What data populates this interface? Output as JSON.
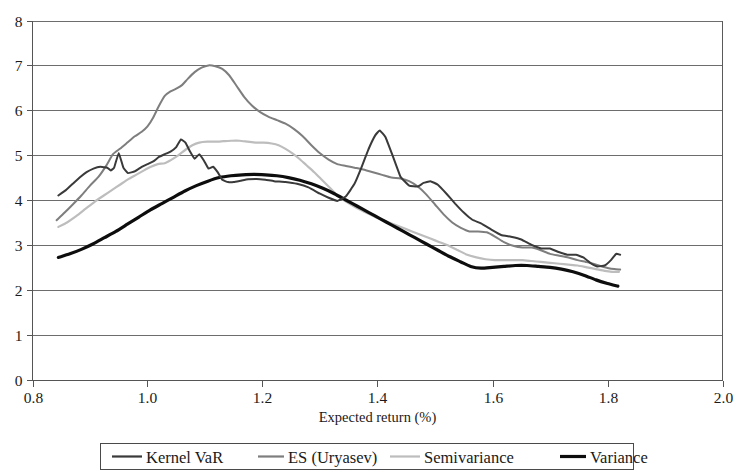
{
  "chart_data": {
    "type": "line",
    "title": "",
    "xlabel": "Expected return (%)",
    "ylabel": "",
    "xlim": [
      0.8,
      2.0
    ],
    "ylim": [
      0,
      8
    ],
    "xticks": [
      "0.8",
      "1.0",
      "1.2",
      "1.4",
      "1.6",
      "1.8",
      "2.0"
    ],
    "xtick_values": [
      0.8,
      1.0,
      1.2,
      1.4,
      1.6,
      1.8,
      2.0
    ],
    "yticks": [
      "0",
      "1",
      "2",
      "3",
      "4",
      "5",
      "6",
      "7",
      "8"
    ],
    "ytick_values": [
      0,
      1,
      2,
      3,
      4,
      5,
      6,
      7,
      8
    ],
    "grid": "horizontal",
    "legend_position": "bottom",
    "series": [
      {
        "name": "Kernel VaR",
        "color": "#3a3a3a",
        "width": 2.0,
        "x": [
          0.845,
          0.858,
          0.87,
          0.882,
          0.894,
          0.906,
          0.918,
          0.93,
          0.936,
          0.942,
          0.95,
          0.958,
          0.966,
          0.978,
          0.99,
          1.0,
          1.01,
          1.02,
          1.03,
          1.04,
          1.05,
          1.058,
          1.066,
          1.074,
          1.082,
          1.09,
          1.098,
          1.106,
          1.114,
          1.122,
          1.13,
          1.14,
          1.15,
          1.162,
          1.175,
          1.19,
          1.205,
          1.22,
          1.24,
          1.26,
          1.28,
          1.3,
          1.315,
          1.33,
          1.345,
          1.36,
          1.372,
          1.384,
          1.396,
          1.404,
          1.414,
          1.426,
          1.44,
          1.455,
          1.47,
          1.48,
          1.492,
          1.505,
          1.52,
          1.535,
          1.55,
          1.565,
          1.58,
          1.598,
          1.615,
          1.632,
          1.65,
          1.668,
          1.685,
          1.7,
          1.715,
          1.73,
          1.745,
          1.758,
          1.77,
          1.782,
          1.795,
          1.806,
          1.815,
          1.822
        ],
        "y": [
          4.1,
          4.22,
          4.36,
          4.5,
          4.62,
          4.7,
          4.74,
          4.72,
          4.66,
          4.72,
          5.05,
          4.72,
          4.6,
          4.64,
          4.74,
          4.8,
          4.86,
          4.96,
          5.02,
          5.08,
          5.18,
          5.35,
          5.28,
          5.08,
          4.92,
          5.02,
          4.88,
          4.7,
          4.74,
          4.62,
          4.45,
          4.4,
          4.4,
          4.43,
          4.46,
          4.47,
          4.45,
          4.42,
          4.4,
          4.36,
          4.28,
          4.14,
          4.05,
          3.98,
          4.08,
          4.36,
          4.72,
          5.12,
          5.44,
          5.55,
          5.4,
          5.0,
          4.52,
          4.32,
          4.3,
          4.38,
          4.42,
          4.34,
          4.14,
          3.92,
          3.72,
          3.56,
          3.48,
          3.34,
          3.22,
          3.18,
          3.12,
          3.0,
          2.92,
          2.92,
          2.84,
          2.78,
          2.78,
          2.72,
          2.6,
          2.52,
          2.54,
          2.66,
          2.8,
          2.78
        ]
      },
      {
        "name": "ES (Uryasev)",
        "color": "#7e7e7e",
        "width": 2.0,
        "x": [
          0.842,
          0.856,
          0.87,
          0.885,
          0.9,
          0.915,
          0.928,
          0.94,
          0.952,
          0.965,
          0.978,
          0.99,
          1.0,
          1.01,
          1.02,
          1.03,
          1.04,
          1.05,
          1.06,
          1.07,
          1.082,
          1.094,
          1.106,
          1.118,
          1.13,
          1.142,
          1.155,
          1.168,
          1.182,
          1.196,
          1.21,
          1.225,
          1.24,
          1.255,
          1.27,
          1.285,
          1.3,
          1.315,
          1.33,
          1.345,
          1.36,
          1.375,
          1.392,
          1.408,
          1.424,
          1.44,
          1.455,
          1.47,
          1.485,
          1.5,
          1.515,
          1.53,
          1.545,
          1.56,
          1.575,
          1.59,
          1.605,
          1.62,
          1.636,
          1.652,
          1.668,
          1.684,
          1.7,
          1.716,
          1.732,
          1.748,
          1.762,
          1.775,
          1.79,
          1.802,
          1.812,
          1.822
        ],
        "y": [
          3.55,
          3.72,
          3.9,
          4.1,
          4.32,
          4.52,
          4.76,
          5.02,
          5.14,
          5.28,
          5.42,
          5.52,
          5.64,
          5.84,
          6.1,
          6.32,
          6.42,
          6.48,
          6.56,
          6.7,
          6.85,
          6.95,
          7.0,
          6.98,
          6.92,
          6.78,
          6.54,
          6.3,
          6.1,
          5.96,
          5.86,
          5.78,
          5.7,
          5.58,
          5.42,
          5.22,
          5.04,
          4.9,
          4.8,
          4.76,
          4.72,
          4.68,
          4.62,
          4.56,
          4.5,
          4.48,
          4.42,
          4.3,
          4.12,
          3.9,
          3.68,
          3.5,
          3.38,
          3.3,
          3.3,
          3.28,
          3.18,
          3.06,
          2.98,
          2.94,
          2.94,
          2.88,
          2.8,
          2.76,
          2.72,
          2.66,
          2.62,
          2.58,
          2.52,
          2.48,
          2.46,
          2.45
        ]
      },
      {
        "name": "Semivariance",
        "color": "#bdbdbd",
        "width": 2.2,
        "x": [
          0.845,
          0.86,
          0.876,
          0.892,
          0.908,
          0.924,
          0.938,
          0.952,
          0.966,
          0.98,
          0.994,
          1.006,
          1.018,
          1.03,
          1.042,
          1.054,
          1.066,
          1.078,
          1.09,
          1.104,
          1.118,
          1.132,
          1.146,
          1.16,
          1.174,
          1.188,
          1.202,
          1.216,
          1.228,
          1.24,
          1.252,
          1.264,
          1.276,
          1.29,
          1.304,
          1.318,
          1.332,
          1.348,
          1.364,
          1.38,
          1.396,
          1.412,
          1.428,
          1.444,
          1.46,
          1.476,
          1.492,
          1.508,
          1.524,
          1.54,
          1.556,
          1.572,
          1.588,
          1.604,
          1.62,
          1.636,
          1.652,
          1.668,
          1.684,
          1.7,
          1.716,
          1.732,
          1.748,
          1.764,
          1.78,
          1.795,
          1.808,
          1.82
        ],
        "y": [
          3.4,
          3.5,
          3.64,
          3.8,
          3.96,
          4.1,
          4.22,
          4.34,
          4.46,
          4.56,
          4.66,
          4.74,
          4.8,
          4.82,
          4.9,
          5.0,
          5.12,
          5.22,
          5.28,
          5.3,
          5.3,
          5.31,
          5.32,
          5.32,
          5.3,
          5.28,
          5.28,
          5.26,
          5.22,
          5.14,
          5.04,
          4.92,
          4.78,
          4.62,
          4.44,
          4.26,
          4.08,
          3.94,
          3.82,
          3.72,
          3.62,
          3.54,
          3.46,
          3.38,
          3.3,
          3.22,
          3.14,
          3.06,
          2.98,
          2.88,
          2.78,
          2.72,
          2.68,
          2.66,
          2.66,
          2.66,
          2.66,
          2.64,
          2.62,
          2.6,
          2.58,
          2.56,
          2.54,
          2.5,
          2.46,
          2.42,
          2.4,
          2.4
        ]
      },
      {
        "name": "Variance",
        "color": "#0d0d0d",
        "width": 3.2,
        "x": [
          0.845,
          0.865,
          0.885,
          0.905,
          0.925,
          0.945,
          0.965,
          0.985,
          1.005,
          1.025,
          1.045,
          1.065,
          1.085,
          1.105,
          1.125,
          1.145,
          1.165,
          1.185,
          1.205,
          1.225,
          1.245,
          1.265,
          1.285,
          1.305,
          1.325,
          1.345,
          1.365,
          1.385,
          1.405,
          1.425,
          1.445,
          1.465,
          1.485,
          1.505,
          1.525,
          1.545,
          1.562,
          1.58,
          1.6,
          1.62,
          1.64,
          1.66,
          1.68,
          1.7,
          1.72,
          1.74,
          1.76,
          1.78,
          1.8,
          1.818
        ],
        "y": [
          2.72,
          2.8,
          2.9,
          3.02,
          3.16,
          3.3,
          3.46,
          3.62,
          3.78,
          3.92,
          4.06,
          4.2,
          4.32,
          4.42,
          4.5,
          4.54,
          4.56,
          4.57,
          4.56,
          4.54,
          4.5,
          4.44,
          4.36,
          4.26,
          4.14,
          4.0,
          3.86,
          3.72,
          3.58,
          3.44,
          3.3,
          3.16,
          3.02,
          2.88,
          2.74,
          2.62,
          2.52,
          2.48,
          2.5,
          2.52,
          2.54,
          2.54,
          2.52,
          2.5,
          2.46,
          2.4,
          2.32,
          2.22,
          2.14,
          2.08
        ]
      }
    ]
  },
  "legend": {
    "items": [
      {
        "label": "Kernel VaR",
        "swatch": "legend-swatch-kernel-var"
      },
      {
        "label": "ES (Uryasev)",
        "swatch": "legend-swatch-es-uryasev"
      },
      {
        "label": "Semivariance",
        "swatch": "legend-swatch-semivariance"
      },
      {
        "label": "Variance",
        "swatch": "legend-swatch-variance"
      }
    ]
  }
}
